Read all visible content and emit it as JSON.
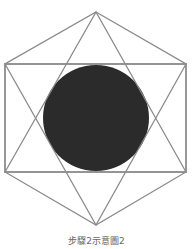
{
  "figure": {
    "hexagon": [
      [
        96,
        12
      ],
      [
        186,
        64
      ],
      [
        186,
        172
      ],
      [
        96,
        225
      ],
      [
        5,
        172
      ],
      [
        5,
        64
      ]
    ],
    "triangle_up": [
      [
        96,
        12
      ],
      [
        186,
        172
      ],
      [
        5,
        172
      ]
    ],
    "triangle_down": [
      [
        96,
        225
      ],
      [
        186,
        64
      ],
      [
        5,
        64
      ]
    ],
    "rectangle": {
      "x": 5,
      "y": 64,
      "w": 181,
      "h": 108
    },
    "circle": {
      "cx": 96,
      "cy": 118,
      "r": 53
    },
    "line_color": "#8a8a8a",
    "fill_color": "#2b2b2b"
  },
  "caption": "步驟2示意圖2"
}
